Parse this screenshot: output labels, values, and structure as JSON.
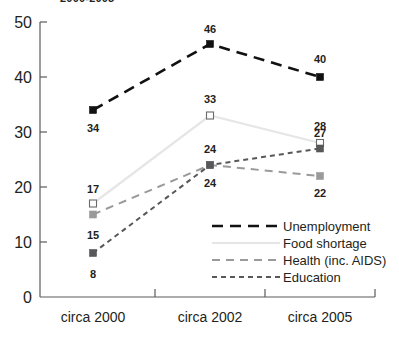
{
  "chart_data": {
    "type": "line",
    "title": "2000-2005",
    "xlabel": "",
    "ylabel": "",
    "categories": [
      "circa 2000",
      "circa 2002",
      "circa 2005"
    ],
    "ylim": [
      0,
      50
    ],
    "yticks": [
      0,
      10,
      20,
      30,
      40,
      50
    ],
    "ytick_labels": [
      "0",
      "10",
      "20",
      "30",
      "40",
      "50"
    ],
    "grid": false,
    "legend_position": "inside-bottom-right",
    "series": [
      {
        "name": "Unemployment",
        "values": [
          34,
          46,
          40
        ],
        "labels": [
          "34",
          "46",
          "40"
        ],
        "color": "#111111",
        "marker": "filled-square",
        "dash": "long-dash"
      },
      {
        "name": "Food shortage",
        "values": [
          17,
          33,
          28
        ],
        "labels": [
          "17",
          "33",
          "28"
        ],
        "color": "#e6e6e6",
        "marker": "hollow-square",
        "dash": "solid"
      },
      {
        "name": "Health (inc. AIDS)",
        "values": [
          15,
          24,
          22
        ],
        "labels": [
          "15",
          "24",
          "22"
        ],
        "color": "#9a9a9a",
        "marker": "filled-square",
        "dash": "medium-dash"
      },
      {
        "name": "Education",
        "values": [
          8,
          24,
          27
        ],
        "labels": [
          "8",
          "24",
          "27"
        ],
        "color": "#58585a",
        "marker": "filled-square",
        "dash": "short-dash"
      }
    ]
  },
  "legend": {
    "items": [
      {
        "label": "Unemployment"
      },
      {
        "label": "Food shortage"
      },
      {
        "label": "Health (inc. AIDS)"
      },
      {
        "label": "Education"
      }
    ]
  }
}
